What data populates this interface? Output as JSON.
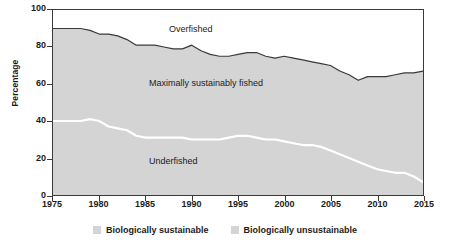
{
  "chart_data": {
    "type": "area",
    "title": "",
    "xlabel": "",
    "ylabel": "Percentage",
    "xlim": [
      1975,
      2015
    ],
    "ylim": [
      0,
      100
    ],
    "yticks": [
      0,
      20,
      40,
      60,
      80,
      100
    ],
    "xticks": [
      1975,
      1980,
      1985,
      1990,
      1995,
      2000,
      2005,
      2010,
      2015
    ],
    "grid": false,
    "legend_position": "bottom-center",
    "stacked": true,
    "band_labels": [
      "Underfished",
      "Maximally sustainably fished",
      "Overfished"
    ],
    "x": [
      1975,
      1976,
      1977,
      1978,
      1979,
      1980,
      1981,
      1982,
      1983,
      1984,
      1985,
      1986,
      1987,
      1988,
      1989,
      1990,
      1991,
      1992,
      1993,
      1994,
      1995,
      1996,
      1997,
      1998,
      1999,
      2000,
      2001,
      2002,
      2003,
      2004,
      2005,
      2006,
      2007,
      2008,
      2009,
      2010,
      2011,
      2012,
      2013,
      2014,
      2015
    ],
    "series": [
      {
        "name": "Underfished",
        "color": "#d4d4d4",
        "boundary_color": "#ffffff",
        "values": [
          40,
          40,
          40,
          40,
          41,
          40,
          37,
          36,
          35,
          32,
          31,
          31,
          31,
          31,
          31,
          30,
          30,
          30,
          30,
          31,
          32,
          32,
          31,
          30,
          30,
          29,
          28,
          27,
          27,
          26,
          24,
          22,
          20,
          18,
          16,
          14,
          13,
          12,
          12,
          10,
          7
        ]
      },
      {
        "name": "Maximally sustainably fished",
        "color": "#d4d4d4",
        "boundary_color": "#3a3a3a",
        "values": [
          50,
          50,
          50,
          50,
          48,
          47,
          50,
          50,
          49,
          49,
          50,
          50,
          49,
          48,
          48,
          51,
          48,
          46,
          45,
          44,
          44,
          45,
          46,
          45,
          44,
          46,
          46,
          46,
          45,
          45,
          46,
          45,
          45,
          44,
          48,
          50,
          51,
          53,
          54,
          56,
          60
        ]
      },
      {
        "name": "Overfished",
        "color": "#ffffff",
        "values": [
          10,
          10,
          10,
          10,
          11,
          13,
          13,
          14,
          16,
          19,
          19,
          19,
          20,
          21,
          21,
          19,
          22,
          24,
          25,
          25,
          24,
          23,
          23,
          25,
          26,
          25,
          26,
          27,
          28,
          29,
          30,
          33,
          35,
          38,
          36,
          36,
          36,
          35,
          34,
          34,
          33
        ]
      }
    ],
    "sustainable_boundary": [
      90,
      90,
      90,
      90,
      89,
      87,
      87,
      86,
      84,
      81,
      81,
      81,
      80,
      79,
      79,
      81,
      78,
      76,
      75,
      75,
      76,
      77,
      77,
      75,
      74,
      75,
      74,
      73,
      72,
      71,
      70,
      67,
      65,
      62,
      64,
      64,
      64,
      65,
      66,
      66,
      67
    ],
    "underfished_boundary": [
      40,
      40,
      40,
      40,
      41,
      40,
      37,
      36,
      35,
      32,
      31,
      31,
      31,
      31,
      31,
      30,
      30,
      30,
      30,
      31,
      32,
      32,
      31,
      30,
      30,
      29,
      28,
      27,
      27,
      26,
      24,
      22,
      20,
      18,
      16,
      14,
      13,
      12,
      12,
      10,
      7
    ]
  },
  "axes": {
    "ylabel": "Percentage",
    "yticks": [
      "100",
      "80",
      "60",
      "40",
      "20",
      "0"
    ],
    "xticks": [
      "1975",
      "1980",
      "1985",
      "1990",
      "1995",
      "2000",
      "2005",
      "2010",
      "2015"
    ]
  },
  "annotations": {
    "overfished": "Overfished",
    "maximally": "Maximally sustainably fished",
    "underfished": "Underfished"
  },
  "legend": {
    "items": [
      {
        "label": "Biologically sustainable",
        "color": "#d4d4d4"
      },
      {
        "label": "Biologically unsustainable",
        "color": "#d4d4d4"
      }
    ]
  },
  "colors": {
    "plot_fill": "#d4d4d4",
    "overfished_fill": "#ffffff",
    "dark_line": "#3a3a3a",
    "white_line": "#ffffff",
    "text": "#1b1b1b"
  },
  "source": {
    "text": ""
  }
}
